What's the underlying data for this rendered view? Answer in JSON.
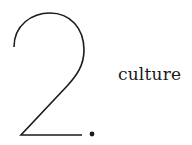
{
  "numeral": {
    "value": "2",
    "suffix": "."
  },
  "label": "culture",
  "colors": {
    "ink": "#1a1a1a",
    "background": "#ffffff"
  }
}
